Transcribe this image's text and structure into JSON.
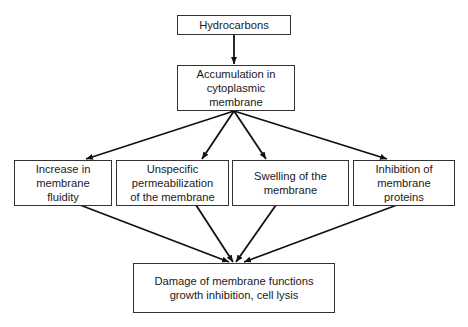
{
  "diagram": {
    "type": "flowchart",
    "nodes": [
      {
        "id": "hydrocarbons",
        "lines": [
          "Hydrocarbons"
        ]
      },
      {
        "id": "accumulation",
        "lines": [
          "Accumulation in",
          "cytoplasmic",
          "membrane"
        ]
      },
      {
        "id": "fluidity",
        "lines": [
          "Increase in",
          "membrane",
          "fluidity"
        ]
      },
      {
        "id": "permeabilization",
        "lines": [
          "Unspecific",
          "permeabilization",
          "of the membrane"
        ]
      },
      {
        "id": "swelling",
        "lines": [
          "Swelling of the",
          "membrane"
        ]
      },
      {
        "id": "inhibition",
        "lines": [
          "Inhibition of",
          "membrane",
          "proteins"
        ]
      },
      {
        "id": "damage",
        "lines": [
          "Damage of membrane functions",
          "growth inhibition, cell lysis"
        ]
      }
    ],
    "edges": [
      {
        "from": "hydrocarbons",
        "to": "accumulation"
      },
      {
        "from": "accumulation",
        "to": "fluidity"
      },
      {
        "from": "accumulation",
        "to": "permeabilization"
      },
      {
        "from": "accumulation",
        "to": "swelling"
      },
      {
        "from": "accumulation",
        "to": "inhibition"
      },
      {
        "from": "fluidity",
        "to": "damage"
      },
      {
        "from": "permeabilization",
        "to": "damage"
      },
      {
        "from": "swelling",
        "to": "damage"
      },
      {
        "from": "inhibition",
        "to": "damage"
      }
    ]
  }
}
